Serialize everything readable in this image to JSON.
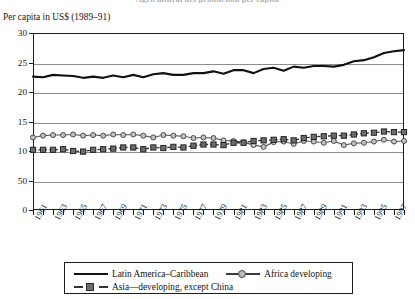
{
  "figure": {
    "cropped_top_title": "Agricultural net production per capita",
    "y_axis_caption": "Per capita in US$ (1989–91)"
  },
  "legend": {
    "position": "below-plot",
    "entries": [
      {
        "label": "Latin America–Caribbean",
        "marker": "none",
        "line": "solid",
        "color": "#111111"
      },
      {
        "label": "Africa developing",
        "marker": "circle",
        "line": "thin",
        "color": "#b9b9b9"
      },
      {
        "label": "Asia—developing, except China",
        "marker": "square",
        "line": "dashed",
        "color": "#6d6d6d"
      }
    ]
  },
  "chart_data": {
    "type": "line",
    "title": "Agricultural net production per capita",
    "xlabel": "",
    "ylabel": "Per capita in US$ (1989–91)",
    "ylim": [
      0,
      30
    ],
    "yticks": [
      0,
      50,
      10,
      15,
      20,
      25,
      30
    ],
    "ytick_labels": [
      "0",
      "50",
      "10",
      "15",
      "20",
      "25",
      "30"
    ],
    "grid": true,
    "legend_position": "bottom",
    "x": [
      1961,
      1962,
      1963,
      1964,
      1965,
      1966,
      1967,
      1968,
      1969,
      1970,
      1971,
      1972,
      1973,
      1974,
      1975,
      1976,
      1977,
      1978,
      1979,
      1980,
      1981,
      1982,
      1983,
      1984,
      1985,
      1986,
      1987,
      1988,
      1989,
      1990,
      1991,
      1992,
      1993,
      1994,
      1995,
      1996,
      1997,
      1998
    ],
    "xtick_labels": [
      "1961",
      "1963",
      "1965",
      "1967",
      "1969",
      "1971",
      "1973",
      "1975",
      "1977",
      "1979",
      "1981",
      "1983",
      "1985",
      "1987",
      "1989",
      "1991",
      "1993",
      "1995",
      "1997"
    ],
    "series": [
      {
        "name": "Latin America–Caribbean",
        "marker": "none",
        "values": [
          22.6,
          22.5,
          22.9,
          22.8,
          22.7,
          22.4,
          22.6,
          22.4,
          22.8,
          22.5,
          22.9,
          22.5,
          23.0,
          23.2,
          22.9,
          22.9,
          23.2,
          23.2,
          23.5,
          23.1,
          23.7,
          23.7,
          23.2,
          23.9,
          24.1,
          23.6,
          24.3,
          24.1,
          24.4,
          24.4,
          24.3,
          24.6,
          25.2,
          25.4,
          25.9,
          26.6,
          26.9,
          27.1
        ]
      },
      {
        "name": "Africa developing",
        "marker": "circle",
        "values": [
          12.3,
          12.6,
          12.7,
          12.7,
          12.8,
          12.6,
          12.7,
          12.6,
          12.8,
          12.7,
          12.8,
          12.6,
          12.3,
          12.7,
          12.6,
          12.5,
          12.2,
          12.3,
          12.2,
          11.8,
          11.7,
          11.5,
          11.0,
          10.7,
          11.5,
          11.6,
          11.2,
          11.7,
          11.6,
          11.4,
          11.7,
          11.0,
          11.3,
          11.4,
          11.6,
          11.9,
          11.6,
          11.7
        ]
      },
      {
        "name": "Asia—developing, except China",
        "marker": "square",
        "values": [
          10.2,
          10.2,
          10.2,
          10.3,
          10.0,
          9.9,
          10.2,
          10.3,
          10.4,
          10.6,
          10.6,
          10.3,
          10.6,
          10.5,
          10.7,
          10.6,
          10.9,
          11.1,
          11.1,
          11.0,
          11.4,
          11.4,
          11.7,
          11.8,
          11.9,
          12.0,
          11.8,
          12.2,
          12.4,
          12.5,
          12.6,
          12.6,
          12.8,
          13.0,
          13.1,
          13.3,
          13.2,
          13.2
        ]
      }
    ]
  }
}
